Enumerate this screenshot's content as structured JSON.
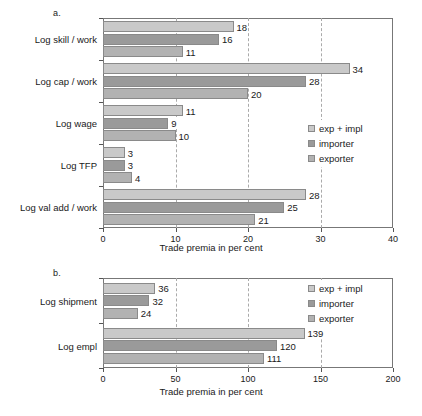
{
  "figure": {
    "background": "#ffffff",
    "series_colors": [
      "#c9c9c9",
      "#9a9a9a",
      "#b2b2b2"
    ]
  },
  "panels": [
    {
      "letter": "a.",
      "legend": [
        "exp + impl",
        "importer",
        "exporter"
      ],
      "xlabel": "Trade premia in per cent",
      "xticks": [
        "0",
        "10",
        "20",
        "30",
        "40"
      ]
    },
    {
      "letter": "b.",
      "legend": [
        "exp + impl",
        "importer",
        "exporter"
      ],
      "xlabel": "Trade premia in per cent",
      "xticks": [
        "0",
        "50",
        "100",
        "150",
        "200"
      ]
    }
  ],
  "chart_data": [
    {
      "type": "bar",
      "orientation": "horizontal",
      "title": "a.",
      "categories": [
        "Log skill / work",
        "Log cap / work",
        "Log wage",
        "Log TFP",
        "Log val add / work"
      ],
      "series": [
        {
          "name": "exp + impl",
          "values": [
            18,
            34,
            11,
            3,
            28
          ],
          "color": "#c9c9c9"
        },
        {
          "name": "importer",
          "values": [
            16,
            28,
            9,
            3,
            25
          ],
          "color": "#9a9a9a"
        },
        {
          "name": "exporter",
          "values": [
            11,
            20,
            10,
            4,
            21
          ],
          "color": "#b2b2b2"
        }
      ],
      "xlabel": "Trade premia in per cent",
      "ylabel": "",
      "xlim": [
        0,
        40
      ],
      "xticks": [
        0,
        10,
        20,
        30,
        40
      ],
      "grid": true,
      "legend_position": "right-middle"
    },
    {
      "type": "bar",
      "orientation": "horizontal",
      "title": "b.",
      "categories": [
        "Log shipment",
        "Log empl"
      ],
      "series": [
        {
          "name": "exp + impl",
          "values": [
            36,
            139
          ],
          "color": "#c9c9c9"
        },
        {
          "name": "importer",
          "values": [
            32,
            120
          ],
          "color": "#9a9a9a"
        },
        {
          "name": "exporter",
          "values": [
            24,
            111
          ],
          "color": "#b2b2b2"
        }
      ],
      "xlabel": "Trade premia in per cent",
      "ylabel": "",
      "xlim": [
        0,
        200
      ],
      "xticks": [
        0,
        50,
        100,
        150,
        200
      ],
      "grid": true,
      "legend_position": "right-top"
    }
  ]
}
